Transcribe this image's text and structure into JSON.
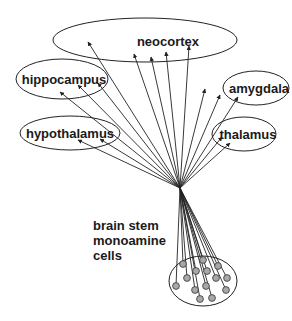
{
  "diagram": {
    "regions": [
      {
        "id": "neocortex",
        "label": "neocortex",
        "cx": 145,
        "cy": 40,
        "rx": 92,
        "ry": 22,
        "lx": 168,
        "ly": 46
      },
      {
        "id": "hippocampus",
        "label": "hippocampus",
        "cx": 62,
        "cy": 79,
        "rx": 46,
        "ry": 20,
        "lx": 64,
        "ly": 84
      },
      {
        "id": "amygdala",
        "label": "amygdala",
        "cx": 256,
        "cy": 88,
        "rx": 33,
        "ry": 17,
        "lx": 259,
        "ly": 93
      },
      {
        "id": "hypothalamus",
        "label": "hypothalamus",
        "cx": 70,
        "cy": 133,
        "rx": 50,
        "ry": 17,
        "lx": 70,
        "ly": 138
      },
      {
        "id": "thalamus",
        "label": "thalamus",
        "cx": 244,
        "cy": 134,
        "rx": 32,
        "ry": 17,
        "lx": 248,
        "ly": 139
      }
    ],
    "source_label": [
      "brain stem",
      "monoamine",
      "cells"
    ],
    "convergence_point": {
      "x": 180,
      "y": 188
    },
    "targets": [
      {
        "x": 88,
        "y": 42
      },
      {
        "x": 134,
        "y": 54
      },
      {
        "x": 151,
        "y": 57
      },
      {
        "x": 166,
        "y": 52
      },
      {
        "x": 189,
        "y": 46
      },
      {
        "x": 60,
        "y": 92
      },
      {
        "x": 78,
        "y": 85
      },
      {
        "x": 98,
        "y": 83
      },
      {
        "x": 205,
        "y": 89
      },
      {
        "x": 220,
        "y": 95
      },
      {
        "x": 238,
        "y": 97
      },
      {
        "x": 78,
        "y": 140
      },
      {
        "x": 100,
        "y": 139
      },
      {
        "x": 222,
        "y": 137
      },
      {
        "x": 230,
        "y": 143
      }
    ],
    "cluster": {
      "cx": 203,
      "cy": 281,
      "rx": 34,
      "ry": 25
    },
    "cells": [
      {
        "x": 183,
        "y": 264
      },
      {
        "x": 196,
        "y": 271
      },
      {
        "x": 203,
        "y": 260
      },
      {
        "x": 207,
        "y": 271
      },
      {
        "x": 218,
        "y": 266
      },
      {
        "x": 187,
        "y": 278
      },
      {
        "x": 216,
        "y": 278
      },
      {
        "x": 227,
        "y": 278
      },
      {
        "x": 176,
        "y": 286
      },
      {
        "x": 195,
        "y": 290
      },
      {
        "x": 206,
        "y": 286
      },
      {
        "x": 226,
        "y": 290
      },
      {
        "x": 200,
        "y": 299
      },
      {
        "x": 212,
        "y": 298
      }
    ]
  }
}
